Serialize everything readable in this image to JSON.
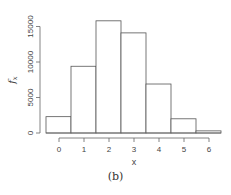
{
  "chart_data": {
    "type": "bar",
    "title": "",
    "xlabel": "x",
    "ylabel": "f_x",
    "categories": [
      "0",
      "1",
      "2",
      "3",
      "4",
      "5",
      "6"
    ],
    "values": [
      2300,
      9400,
      15800,
      14100,
      6900,
      2000,
      300
    ],
    "ylim": [
      0,
      16000
    ],
    "yticks": [
      0,
      5000,
      10000,
      15000
    ],
    "xticks": [
      0,
      1,
      2,
      3,
      4,
      5,
      6
    ],
    "grid": false,
    "legend": null,
    "bar_fill": "#ffffff",
    "bar_stroke": "#555555"
  },
  "caption": "(b)"
}
